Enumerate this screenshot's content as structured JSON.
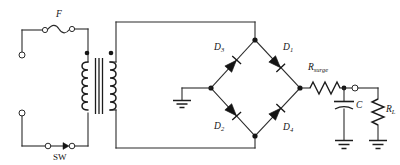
{
  "diagram": {
    "type": "circuit-schematic",
    "line_color": "#2b2b2b",
    "fill_color": "#141414",
    "background": "#ffffff"
  },
  "labels": {
    "fuse": {
      "base": "F",
      "sub": ""
    },
    "switch": {
      "base": "SW",
      "sub": ""
    },
    "diode1": {
      "base": "D",
      "sub": "1"
    },
    "diode2": {
      "base": "D",
      "sub": "2"
    },
    "diode3": {
      "base": "D",
      "sub": "3"
    },
    "diode4": {
      "base": "D",
      "sub": "4"
    },
    "surge_resistor": {
      "base": "R",
      "sub": "surge"
    },
    "capacitor": {
      "base": "C",
      "sub": ""
    },
    "load_resistor": {
      "base": "R",
      "sub": "L"
    }
  },
  "components": [
    {
      "name": "input-terminal-top",
      "kind": "open-terminal"
    },
    {
      "name": "input-terminal-bottom",
      "kind": "open-terminal"
    },
    {
      "name": "fuse",
      "kind": "fuse",
      "label": "F"
    },
    {
      "name": "switch",
      "kind": "switch",
      "label": "SW"
    },
    {
      "name": "transformer",
      "kind": "transformer",
      "polarity_dots": 2
    },
    {
      "name": "diode-d3",
      "kind": "diode",
      "label": "D3"
    },
    {
      "name": "diode-d1",
      "kind": "diode",
      "label": "D1"
    },
    {
      "name": "diode-d2",
      "kind": "diode",
      "label": "D2"
    },
    {
      "name": "diode-d4",
      "kind": "diode",
      "label": "D4"
    },
    {
      "name": "surge-resistor",
      "kind": "resistor",
      "label": "Rsurge"
    },
    {
      "name": "filter-capacitor",
      "kind": "capacitor",
      "label": "C"
    },
    {
      "name": "load-resistor",
      "kind": "resistor",
      "label": "RL"
    },
    {
      "name": "output-terminal",
      "kind": "open-terminal"
    },
    {
      "name": "ground-bridge",
      "kind": "ground"
    },
    {
      "name": "ground-capacitor",
      "kind": "ground"
    },
    {
      "name": "ground-load",
      "kind": "ground"
    }
  ]
}
